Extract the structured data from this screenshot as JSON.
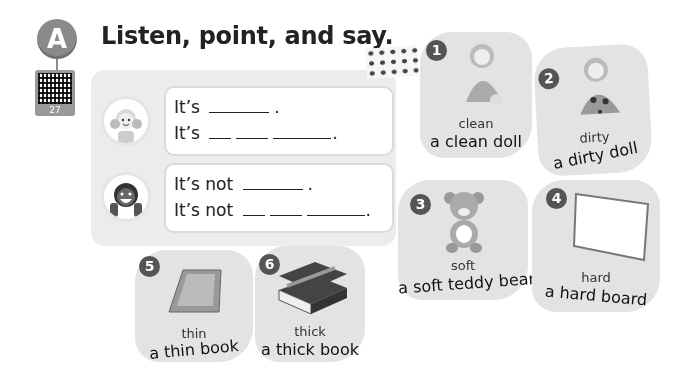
{
  "section": {
    "letter": "A",
    "qr_number": "27"
  },
  "title": "Listen, point, and say.",
  "prompts": [
    {
      "speaker": "girl",
      "lines": [
        {
          "prefix": "It’s",
          "blanks": [
            60
          ],
          "end": "."
        },
        {
          "prefix": "It’s",
          "blanks": [
            22,
            32,
            58
          ],
          "end": "."
        }
      ]
    },
    {
      "speaker": "boy",
      "lines": [
        {
          "prefix": "It’s not",
          "blanks": [
            60
          ],
          "end": "."
        },
        {
          "prefix": "It’s not",
          "blanks": [
            22,
            32,
            58
          ],
          "end": "."
        }
      ]
    }
  ],
  "cards": [
    {
      "number": "1",
      "adjective": "clean",
      "phrase": "a clean doll",
      "picture": "clean-doll"
    },
    {
      "number": "2",
      "adjective": "dirty",
      "phrase": "a dirty doll",
      "picture": "dirty-doll"
    },
    {
      "number": "3",
      "adjective": "soft",
      "phrase": "a soft teddy bear",
      "picture": "teddy-bear"
    },
    {
      "number": "4",
      "adjective": "hard",
      "phrase": "a hard board",
      "picture": "whiteboard"
    },
    {
      "number": "5",
      "adjective": "thin",
      "phrase": "a thin book",
      "picture": "thin-book"
    },
    {
      "number": "6",
      "adjective": "thick",
      "phrase": "a thick book",
      "picture": "thick-book"
    }
  ]
}
